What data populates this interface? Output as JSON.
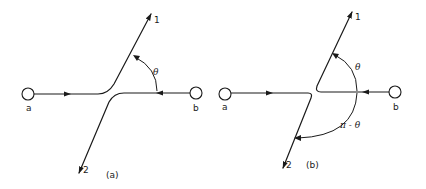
{
  "figure": {
    "panels": [
      {
        "id": "a",
        "caption": "(a)",
        "nodes": [
          {
            "label": "a"
          },
          {
            "label": "b"
          }
        ],
        "outgoing": [
          {
            "label": "1"
          },
          {
            "label": "2"
          }
        ],
        "angles": [
          {
            "label": "θ"
          }
        ]
      },
      {
        "id": "b",
        "caption": "(b)",
        "nodes": [
          {
            "label": "a"
          },
          {
            "label": "b"
          }
        ],
        "outgoing": [
          {
            "label": "1"
          },
          {
            "label": "2"
          }
        ],
        "angles": [
          {
            "label": "θ"
          },
          {
            "label": "π - θ"
          }
        ]
      }
    ],
    "colors": {
      "ink": "#1a1a1a",
      "background": "#ffffff"
    }
  }
}
